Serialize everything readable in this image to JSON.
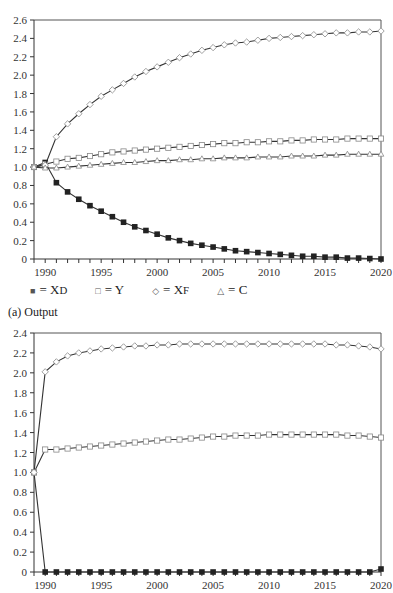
{
  "chart_data": [
    {
      "type": "line",
      "title": "(a) Output",
      "xlabel": "",
      "ylabel": "",
      "x": [
        1989,
        1990,
        1991,
        1992,
        1993,
        1994,
        1995,
        1996,
        1997,
        1998,
        1999,
        2000,
        2001,
        2002,
        2003,
        2004,
        2005,
        2006,
        2007,
        2008,
        2009,
        2010,
        2011,
        2012,
        2013,
        2014,
        2015,
        2016,
        2017,
        2018,
        2019,
        2020
      ],
      "xticks": [
        1990,
        1995,
        2000,
        2005,
        2010,
        2015,
        2020
      ],
      "ylim": [
        0,
        2.6
      ],
      "yticks": [
        "0",
        "0.2",
        "0.4",
        "0.6",
        "0.8",
        "1.0",
        "1.2",
        "1.4",
        "1.6",
        "1.8",
        "2.0",
        "2.2",
        "2.4",
        "2.6"
      ],
      "grid": false,
      "series": [
        {
          "name": "X_D",
          "marker": "filled-square",
          "values": [
            1.0,
            1.05,
            0.83,
            0.73,
            0.65,
            0.58,
            0.52,
            0.46,
            0.4,
            0.35,
            0.31,
            0.27,
            0.23,
            0.2,
            0.17,
            0.15,
            0.13,
            0.11,
            0.09,
            0.08,
            0.07,
            0.06,
            0.05,
            0.04,
            0.03,
            0.03,
            0.02,
            0.02,
            0.01,
            0.01,
            0.005,
            0.0
          ]
        },
        {
          "name": "Y",
          "marker": "open-square",
          "values": [
            1.0,
            1.03,
            1.06,
            1.09,
            1.1,
            1.12,
            1.14,
            1.16,
            1.17,
            1.18,
            1.19,
            1.2,
            1.21,
            1.22,
            1.23,
            1.24,
            1.25,
            1.26,
            1.26,
            1.27,
            1.27,
            1.28,
            1.28,
            1.29,
            1.29,
            1.3,
            1.3,
            1.3,
            1.31,
            1.31,
            1.31,
            1.31
          ]
        },
        {
          "name": "X_F",
          "marker": "open-diamond",
          "values": [
            1.0,
            1.02,
            1.33,
            1.47,
            1.58,
            1.68,
            1.77,
            1.84,
            1.91,
            1.98,
            2.04,
            2.09,
            2.14,
            2.19,
            2.23,
            2.27,
            2.3,
            2.33,
            2.35,
            2.36,
            2.38,
            2.4,
            2.41,
            2.42,
            2.43,
            2.44,
            2.45,
            2.46,
            2.46,
            2.47,
            2.47,
            2.48
          ]
        },
        {
          "name": "C",
          "marker": "open-triangle",
          "values": [
            1.0,
            0.99,
            0.99,
            1.0,
            1.01,
            1.02,
            1.03,
            1.04,
            1.05,
            1.05,
            1.06,
            1.07,
            1.07,
            1.08,
            1.08,
            1.09,
            1.09,
            1.1,
            1.1,
            1.1,
            1.11,
            1.11,
            1.11,
            1.12,
            1.12,
            1.12,
            1.13,
            1.13,
            1.14,
            1.14,
            1.14,
            1.14
          ]
        }
      ],
      "legend": [
        "■ = X_D",
        "□ = Y",
        "◇ = X_F",
        "△ = C"
      ],
      "legend_position": "below"
    },
    {
      "type": "line",
      "title": "",
      "xlabel": "",
      "ylabel": "",
      "x": [
        1989,
        1990,
        1991,
        1992,
        1993,
        1994,
        1995,
        1996,
        1997,
        1998,
        1999,
        2000,
        2001,
        2002,
        2003,
        2004,
        2005,
        2006,
        2007,
        2008,
        2009,
        2010,
        2011,
        2012,
        2013,
        2014,
        2015,
        2016,
        2017,
        2018,
        2019,
        2020
      ],
      "xticks": [
        1990,
        1995,
        2000,
        2005,
        2010,
        2015,
        2020
      ],
      "ylim": [
        0,
        2.4
      ],
      "yticks": [
        "0",
        "0.2",
        "0.4",
        "0.6",
        "0.8",
        "1.0",
        "1.2",
        "1.4",
        "1.6",
        "1.8",
        "2.0",
        "2.2",
        "2.4"
      ],
      "grid": false,
      "series": [
        {
          "name": "X_D",
          "marker": "filled-square",
          "values": [
            1.0,
            0,
            0,
            0,
            0,
            0,
            0,
            0,
            0,
            0,
            0,
            0,
            0,
            0,
            0,
            0,
            0,
            0,
            0,
            0,
            0,
            0,
            0,
            0,
            0,
            0,
            0,
            0,
            0,
            0,
            0,
            0.03
          ]
        },
        {
          "name": "Y",
          "marker": "open-square",
          "values": [
            1.0,
            1.23,
            1.23,
            1.24,
            1.25,
            1.26,
            1.27,
            1.28,
            1.29,
            1.3,
            1.31,
            1.32,
            1.33,
            1.33,
            1.34,
            1.35,
            1.36,
            1.36,
            1.37,
            1.37,
            1.37,
            1.38,
            1.38,
            1.38,
            1.38,
            1.38,
            1.38,
            1.38,
            1.37,
            1.37,
            1.36,
            1.35
          ]
        },
        {
          "name": "X_F",
          "marker": "open-diamond",
          "values": [
            1.0,
            2.01,
            2.11,
            2.17,
            2.2,
            2.22,
            2.24,
            2.25,
            2.26,
            2.27,
            2.27,
            2.28,
            2.28,
            2.29,
            2.29,
            2.29,
            2.29,
            2.29,
            2.29,
            2.29,
            2.29,
            2.29,
            2.29,
            2.29,
            2.29,
            2.29,
            2.29,
            2.28,
            2.28,
            2.27,
            2.26,
            2.24
          ]
        }
      ]
    }
  ],
  "legend": {
    "items": [
      {
        "marker": "■",
        "label": "= X",
        "sub": "D"
      },
      {
        "marker": "□",
        "label": "= Y",
        "sub": ""
      },
      {
        "marker": "◇",
        "label": "= X",
        "sub": "F"
      },
      {
        "marker": "△",
        "label": "= C",
        "sub": ""
      }
    ]
  },
  "caption": "(a) Output"
}
